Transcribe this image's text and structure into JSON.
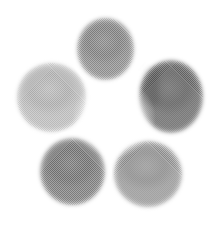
{
  "image": {
    "kind": "natural-image",
    "subject": "five grey circular discs arranged in a ring",
    "caption": "Five flat grey discs of differing brightness arranged in a pentagonal rosette on a plain white background",
    "width": 221,
    "height": 228,
    "background_color": "#ffffff",
    "texture": "halftone dither / scanned print grain",
    "edge_quality": "soft blurred edges with pale halo"
  },
  "palette": {
    "background": "#ffffff",
    "lightest_disc": "#b4b4b4",
    "darkest_disc": "#6e6e6e",
    "center_glow": "#ffffff"
  },
  "discs": [
    {
      "id": "disc-left",
      "label": "left disc",
      "position": "left",
      "brightness_rank": 1,
      "tone": "lightest grey",
      "fill": "#b4b4b4",
      "fill_edge": "#c3c3c3",
      "x": 17,
      "y": 63,
      "width": 69,
      "height": 69
    },
    {
      "id": "disc-top",
      "label": "top disc",
      "position": "top",
      "brightness_rank": 3,
      "tone": "medium-dark grey",
      "fill": "#8b8b8b",
      "fill_edge": "#9b9b9b",
      "x": 77,
      "y": 18,
      "width": 57,
      "height": 62
    },
    {
      "id": "disc-right",
      "label": "right disc",
      "position": "right",
      "brightness_rank": 5,
      "tone": "darkest grey",
      "fill": "#6e6e6e",
      "fill_edge": "#7c7c7c",
      "x": 139,
      "y": 60,
      "width": 64,
      "height": 73
    },
    {
      "id": "disc-bottom-left",
      "label": "bottom left disc",
      "position": "bottom-left",
      "brightness_rank": 4,
      "tone": "dark grey",
      "fill": "#7e7e7e",
      "fill_edge": "#8d8d8d",
      "x": 40,
      "y": 138,
      "width": 65,
      "height": 67
    },
    {
      "id": "disc-bottom-right",
      "label": "bottom right disc",
      "position": "bottom-right",
      "brightness_rank": 2,
      "tone": "medium grey",
      "fill": "#949494",
      "fill_edge": "#a3a3a3",
      "x": 114,
      "y": 141,
      "width": 68,
      "height": 66
    }
  ]
}
